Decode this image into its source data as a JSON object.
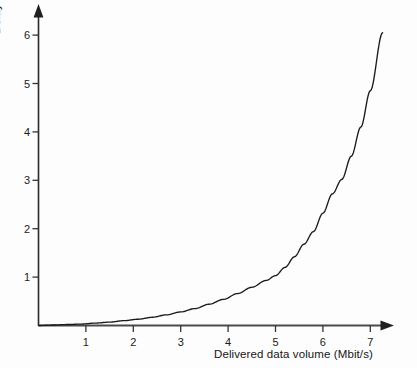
{
  "chart_data": {
    "type": "line",
    "title": "",
    "subtitle": "",
    "xlabel": "Delivered data volume (Mbit/s)",
    "ylabel": "Delay (ms)",
    "xlim": [
      0,
      7.65
    ],
    "ylim": [
      0,
      6.45
    ],
    "xticks": [
      "1",
      "2",
      "3",
      "4",
      "5",
      "6",
      "7"
    ],
    "xtick_values": [
      1,
      2,
      3,
      4,
      5,
      6,
      7
    ],
    "yticks": [
      "1",
      "2",
      "3",
      "4",
      "5",
      "6"
    ],
    "ytick_values": [
      1,
      2,
      3,
      4,
      5,
      6
    ],
    "grid": false,
    "legend": null,
    "legend_position": "none",
    "axis_style": "arrow-ended L-shaped axes, ticks outside, no box",
    "series": [
      {
        "name": "Delay vs delivered data volume",
        "color": "#1a1a1a",
        "x": [
          0.0,
          0.3,
          0.6,
          0.9,
          1.2,
          1.5,
          1.8,
          2.1,
          2.4,
          2.7,
          3.0,
          3.3,
          3.6,
          3.9,
          4.2,
          4.5,
          4.8,
          5.0,
          5.2,
          5.4,
          5.6,
          5.8,
          6.0,
          6.2,
          6.4,
          6.6,
          6.8,
          7.0,
          7.26
        ],
        "y": [
          0.0,
          0.01,
          0.02,
          0.03,
          0.05,
          0.07,
          0.1,
          0.13,
          0.17,
          0.22,
          0.28,
          0.35,
          0.44,
          0.54,
          0.66,
          0.79,
          0.93,
          1.03,
          1.2,
          1.42,
          1.68,
          1.94,
          2.32,
          2.72,
          3.02,
          3.5,
          4.1,
          4.85,
          6.05
        ]
      }
    ],
    "annotations": []
  },
  "axes": {
    "x_title": "Delivered data volume (Mbit/s)",
    "y_title": "Delay (ms)",
    "x_tick_labels": [
      "1",
      "2",
      "3",
      "4",
      "5",
      "6",
      "7"
    ],
    "y_tick_labels": [
      "1",
      "2",
      "3",
      "4",
      "5",
      "6"
    ]
  },
  "colors": {
    "axis": "#2a2a2a",
    "curve": "#1a1a1a",
    "background": "#fdfdfd",
    "text": "#151515"
  }
}
